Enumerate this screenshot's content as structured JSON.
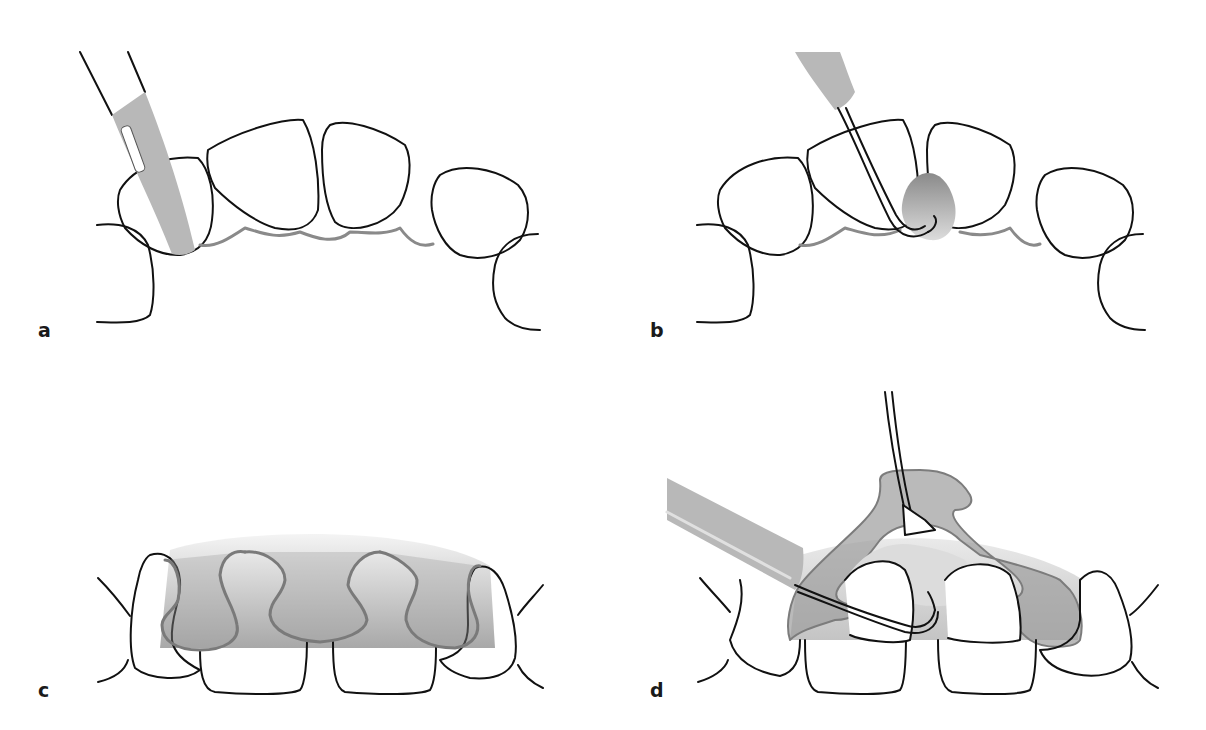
{
  "figure": {
    "panels": [
      {
        "id": "a",
        "label": "a",
        "description": "Scalpel blade incision at gingival margin around anterior teeth"
      },
      {
        "id": "b",
        "label": "b",
        "description": "Curved elevator lifting interdental papilla"
      },
      {
        "id": "c",
        "label": "c",
        "description": "Papillae outlined with flap shading (palatal view)"
      },
      {
        "id": "d",
        "label": "d",
        "description": "Flap elevated with elevator and tissue forceps"
      }
    ],
    "colors": {
      "outline": "#111111",
      "gingiva_line": "#888888",
      "instrument_gray": "#b5b5b5",
      "tissue_dark": "#8e8e8e",
      "tissue_light": "#d8d8d8"
    }
  }
}
